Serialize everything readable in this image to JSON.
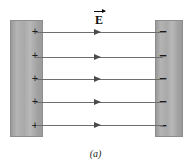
{
  "figure": {
    "caption": "(a)",
    "field_label": "E",
    "field_label_kind": "vector-arrow-over-letter",
    "plates": {
      "left": {
        "name": "positive-plate",
        "charge_symbol": "+",
        "charge_count": 5,
        "fill_color": "#ababab",
        "border_color": "#8d8d8d"
      },
      "right": {
        "name": "negative-plate",
        "charge_symbol": "−",
        "charge_count": 5,
        "fill_color": "#ababab",
        "border_color": "#8d8d8d"
      }
    },
    "charges_positive": [
      "+",
      "+",
      "+",
      "+",
      "+"
    ],
    "charges_negative": [
      "−",
      "−",
      "−",
      "−",
      "−"
    ],
    "field_lines": {
      "count": 5,
      "direction": "left-to-right",
      "line_color": "#6e6e6e",
      "arrow_color": "#4a4a4a"
    },
    "background_color": "#ffffff"
  }
}
